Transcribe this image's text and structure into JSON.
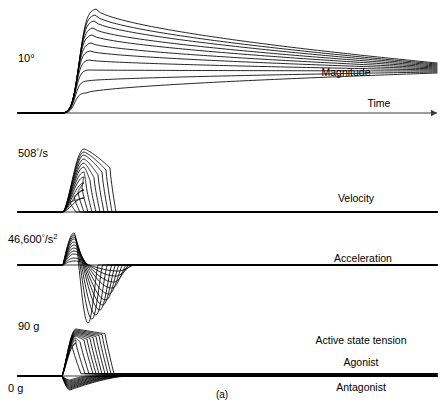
{
  "figure": {
    "caption": "(a)",
    "background_color": "#ffffff",
    "ink_color": "#000000",
    "axis_color": "#3a3a3a",
    "width": 445,
    "height": 410
  },
  "panels": [
    {
      "id": "magnitude",
      "scale_label": "10",
      "scale_unit": "°",
      "scale_sup": "",
      "trace_label": "Magnitude",
      "axis_label": "Time",
      "has_arrow": true
    },
    {
      "id": "velocity",
      "scale_label": "508",
      "scale_unit": "/s",
      "scale_sup": "",
      "trace_label": "Velocity",
      "axis_label": "",
      "has_arrow": false
    },
    {
      "id": "acceleration",
      "scale_label": "46,600",
      "scale_unit": "/s",
      "scale_sup": "2",
      "trace_label": "Acceleration",
      "axis_label": "",
      "has_arrow": false
    },
    {
      "id": "tension",
      "scale_label": "90 g",
      "scale_label_low": "0 g",
      "scale_unit": "",
      "scale_sup": "",
      "trace_label": "Active state tension",
      "agonist_label": "Agonist",
      "antagonist_label": "Antagonist",
      "has_arrow": false
    }
  ],
  "chart_data": {
    "type": "line",
    "title": "",
    "xlabel": "Time",
    "ylabel": "",
    "n_curves": 11,
    "series_note": "Family of saccadic eye movement responses of increasing amplitude",
    "magnitude": {
      "ylabel": "10°",
      "baseline_y": 113,
      "axis_x_start": 18,
      "axis_x_end": 437,
      "onset_x": 63,
      "peak_x": 96,
      "converge_x": 437,
      "peak_heights": [
        104,
        98,
        92,
        85,
        78,
        70,
        62,
        53,
        43,
        32,
        20
      ],
      "converge_heights": [
        50,
        49,
        48,
        47,
        46,
        45,
        44,
        43,
        42,
        41,
        40
      ],
      "decay_shape": "slow exponential settling to common bundle"
    },
    "velocity": {
      "ylabel": "508°/s",
      "baseline_y": 212,
      "axis_x_start": 18,
      "axis_x_end": 437,
      "onset_x": 63,
      "peak_x": 84,
      "peak_heights": [
        63,
        60,
        57,
        53,
        49,
        45,
        40,
        35,
        29,
        22,
        14
      ],
      "end_x": [
        116,
        112,
        108,
        104,
        100,
        96,
        92,
        88,
        84,
        80,
        76
      ],
      "plateau_note": "broad plateau after peak then sharp fall to baseline"
    },
    "acceleration": {
      "ylabel": "46,600°/s²",
      "baseline_y": 265,
      "axis_x_start": 18,
      "axis_x_end": 437,
      "onset_x": 63,
      "pos_peak_x": 74,
      "pos_peak_heights": [
        32,
        30,
        28,
        26,
        23,
        20,
        17,
        14,
        11,
        7,
        4
      ],
      "neg_peak_depths": [
        58,
        54,
        50,
        45,
        40,
        35,
        29,
        23,
        17,
        11,
        6
      ],
      "neg_peak_x": [
        88,
        92,
        96,
        100,
        103,
        106,
        109,
        112,
        114,
        116,
        118
      ],
      "shape": "biphasic: positive spike then deeper negative lobe"
    },
    "tension": {
      "ylabel_high": "90 g",
      "ylabel_low": "0 g",
      "baseline_y": 376,
      "axis_x_start": 18,
      "axis_x_end": 437,
      "onset_x": 62,
      "agonist_peak_heights": [
        47,
        46,
        45,
        44,
        43,
        42,
        41,
        40,
        38,
        36,
        33
      ],
      "agonist_fall_x": [
        105,
        102,
        99,
        96,
        93,
        90,
        87,
        84,
        80,
        76,
        72
      ],
      "antagonist_depths": [
        14,
        13,
        12,
        11,
        10,
        9,
        8,
        7,
        6,
        5,
        4
      ],
      "antagonist_end_x": [
        128,
        125,
        122,
        119,
        116,
        112,
        108,
        104,
        99,
        94,
        88
      ],
      "shape": "agonist pulse-step above baseline, antagonist inhibition dip below"
    }
  }
}
